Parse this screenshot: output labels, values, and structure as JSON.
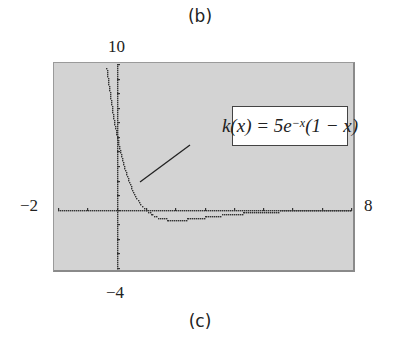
{
  "top_caption": "(b)",
  "bottom_caption": "(c)",
  "axis_labels": {
    "ymax": "10",
    "ymin": "−4",
    "xmin": "−2",
    "xmax": "8"
  },
  "function_label": "k(x) = 5e^(−x)(1 − x)",
  "function_label_display": "k(x) = 5e",
  "function_label_exp": "−x",
  "function_label_tail": "(1 − x)",
  "colors": {
    "panel_bg": "#d3d3d3",
    "plot_dots": "#333333",
    "label_bg": "#ffffff"
  },
  "chart_data": {
    "type": "line",
    "title": "",
    "function": "k(x) = 5e^(-x)(1 - x)",
    "xlabel": "",
    "ylabel": "",
    "xlim": [
      -2,
      8
    ],
    "ylim": [
      -4,
      10
    ],
    "x_ticks": [
      -2,
      -1,
      0,
      1,
      2,
      3,
      4,
      5,
      6,
      7,
      8
    ],
    "y_ticks": [
      -4,
      -3,
      -2,
      -1,
      0,
      1,
      2,
      3,
      4,
      5,
      6,
      7,
      8,
      9,
      10
    ],
    "grid": false,
    "style": "graphing-calculator dotted plot",
    "series": [
      {
        "name": "k(x)",
        "x": [
          -0.2,
          -0.1,
          0,
          0.25,
          0.5,
          0.75,
          1,
          1.5,
          2,
          3,
          4,
          5,
          6,
          7,
          8
        ],
        "values": [
          7.33,
          6.08,
          5.0,
          2.92,
          1.52,
          0.59,
          0.0,
          -0.56,
          -0.68,
          -0.5,
          -0.27,
          -0.13,
          -0.06,
          -0.03,
          -0.01
        ]
      }
    ],
    "annotations": [
      {
        "text": "k(x) = 5e^(-x)(1 - x)",
        "points_to": [
          0.3,
          2.5
        ]
      }
    ]
  }
}
